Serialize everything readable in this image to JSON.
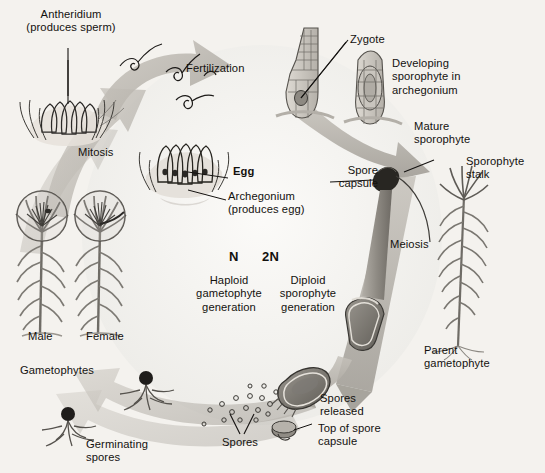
{
  "diagram": {
    "background_color": "#f4f2ee",
    "ink_color": "#13110e",
    "arrow_color": "#b9b5ae"
  },
  "labels": {
    "antheridium": "Antheridium\n(produces sperm)",
    "fertilization": "Fertilization",
    "mitosis": "Mitosis",
    "egg": "Egg",
    "archegonium": "Archegonium\n(produces egg)",
    "zygote": "Zygote",
    "developing_sporophyte": "Developing\nsporophyte in\narchegonium",
    "mature_sporophyte": "Mature\nsporophyte",
    "sporophyte_stalk": "Sporophyte\nstalk",
    "spore_capsule": "Spore\ncapsule",
    "meiosis": "Meiosis",
    "parent_gametophyte": "Parent\ngametophyte",
    "spores_released": "Spores\nreleased",
    "top_of_spore_capsule": "Top of spore\ncapsule",
    "spores": "Spores",
    "germinating_spores": "Germinating\nspores",
    "gametophytes": "Gametophytes",
    "male": "Male",
    "female": "Female",
    "n": "N",
    "two_n": "2N",
    "haploid_generation": "Haploid\ngametophyte\ngeneration",
    "diploid_generation": "Diploid\nsporophyte\ngeneration"
  },
  "structures": {
    "male_gametophyte": "male-gametophyte-plant",
    "female_gametophyte": "female-gametophyte-plant",
    "parent_gametophyte_plant": "parent-gametophyte-plant",
    "antheridium_cluster": "antheridium-cluster",
    "archegonium_cluster": "archegonium-cluster",
    "sperm_cells": "sperm-cells",
    "zygote_archegonium": "zygote-in-archegonium",
    "developing_sporophyte_structure": "developing-sporophyte",
    "mature_sporophyte_structure": "mature-sporophyte-stalk-capsule",
    "tilted_capsule": "tilted-spore-capsule",
    "capsule_lid": "spore-capsule-lid",
    "spore_dots": "scattered-spores",
    "germinating_spore_a": "germinating-spore-left",
    "germinating_spore_b": "germinating-spore-right"
  }
}
